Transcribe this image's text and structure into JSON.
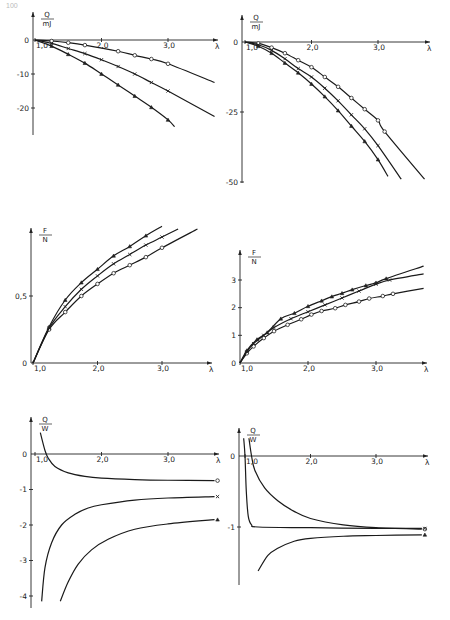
{
  "page": {
    "number": "100"
  },
  "chart_data": [
    {
      "id": "chart1",
      "type": "line",
      "position": "top-left",
      "ylabel_num": "Q",
      "ylabel_den": "mJ",
      "xlabel": "λ",
      "xticks": [
        "1,0",
        "2,0",
        "3,0"
      ],
      "yticks": [
        "0",
        "-10",
        "-20"
      ],
      "xlim": [
        1.0,
        3.7
      ],
      "ylim": [
        -25,
        2
      ],
      "series": [
        {
          "name": "circle",
          "marker": "o",
          "points": [
            [
              1.0,
              0
            ],
            [
              1.25,
              -0.3
            ],
            [
              1.5,
              -0.8
            ],
            [
              1.75,
              -1.5
            ],
            [
              2.25,
              -3.3
            ],
            [
              2.5,
              -4.5
            ],
            [
              2.75,
              -5.6
            ],
            [
              3.0,
              -7.0
            ],
            [
              3.7,
              -12.5
            ]
          ]
        },
        {
          "name": "cross",
          "marker": "x",
          "points": [
            [
              1.0,
              0
            ],
            [
              1.25,
              -1.0
            ],
            [
              1.5,
              -2.5
            ],
            [
              1.75,
              -4.0
            ],
            [
              2.0,
              -5.8
            ],
            [
              2.25,
              -7.8
            ],
            [
              2.5,
              -10.0
            ],
            [
              2.75,
              -12.5
            ],
            [
              3.0,
              -15.0
            ],
            [
              3.7,
              -22.5
            ]
          ]
        },
        {
          "name": "triangle",
          "marker": "^",
          "points": [
            [
              1.0,
              0
            ],
            [
              1.25,
              -1.8
            ],
            [
              1.5,
              -4.2
            ],
            [
              1.75,
              -6.8
            ],
            [
              2.0,
              -10.0
            ],
            [
              2.25,
              -13.2
            ],
            [
              2.5,
              -16.5
            ],
            [
              2.75,
              -19.8
            ],
            [
              3.0,
              -23.5
            ],
            [
              3.1,
              -25.5
            ]
          ]
        }
      ]
    },
    {
      "id": "chart2",
      "type": "line",
      "position": "top-right",
      "ylabel_num": "Q",
      "ylabel_den": "mJ",
      "xlabel": "λ",
      "xticks": [
        "1,0",
        "2,0",
        "3,0"
      ],
      "yticks": [
        "0",
        "-25",
        "-50"
      ],
      "xlim": [
        1.0,
        3.7
      ],
      "ylim": [
        -50,
        2
      ],
      "series": [
        {
          "name": "circle",
          "marker": "o",
          "points": [
            [
              1.0,
              0
            ],
            [
              1.2,
              -0.5
            ],
            [
              1.4,
              -2.0
            ],
            [
              1.6,
              -4.0
            ],
            [
              1.8,
              -6.5
            ],
            [
              2.0,
              -9.0
            ],
            [
              2.2,
              -12.5
            ],
            [
              2.4,
              -16.0
            ],
            [
              2.6,
              -20.0
            ],
            [
              2.8,
              -24.0
            ],
            [
              3.0,
              -28.0
            ],
            [
              3.1,
              -32.0
            ],
            [
              3.7,
              -49.0
            ]
          ]
        },
        {
          "name": "cross",
          "marker": "x",
          "points": [
            [
              1.0,
              0
            ],
            [
              1.2,
              -1.0
            ],
            [
              1.4,
              -3.0
            ],
            [
              1.6,
              -6.0
            ],
            [
              1.8,
              -9.5
            ],
            [
              2.0,
              -12.5
            ],
            [
              2.2,
              -16.5
            ],
            [
              2.4,
              -21.0
            ],
            [
              2.6,
              -26.0
            ],
            [
              2.8,
              -31.0
            ],
            [
              3.0,
              -37.0
            ],
            [
              3.35,
              -49.0
            ]
          ]
        },
        {
          "name": "triangle",
          "marker": "^",
          "points": [
            [
              1.0,
              0
            ],
            [
              1.2,
              -1.5
            ],
            [
              1.4,
              -4.0
            ],
            [
              1.6,
              -7.5
            ],
            [
              1.8,
              -11.0
            ],
            [
              2.0,
              -15.0
            ],
            [
              2.2,
              -19.5
            ],
            [
              2.4,
              -24.5
            ],
            [
              2.6,
              -30.0
            ],
            [
              2.8,
              -35.5
            ],
            [
              3.0,
              -42.0
            ],
            [
              3.15,
              -48.0
            ]
          ]
        }
      ]
    },
    {
      "id": "chart3",
      "type": "line",
      "position": "middle-left",
      "ylabel_num": "F",
      "ylabel_den": "N",
      "xlabel": "λ",
      "xticks": [
        "1,0",
        "2,0",
        "3,0"
      ],
      "yticks": [
        "0",
        "0,5"
      ],
      "xlim": [
        1.0,
        3.7
      ],
      "ylim": [
        0,
        1.05
      ],
      "series": [
        {
          "name": "circle",
          "marker": "o",
          "points": [
            [
              1.0,
              0
            ],
            [
              1.25,
              0.25
            ],
            [
              1.5,
              0.38
            ],
            [
              1.75,
              0.5
            ],
            [
              2.0,
              0.59
            ],
            [
              2.25,
              0.67
            ],
            [
              2.5,
              0.73
            ],
            [
              2.75,
              0.79
            ],
            [
              3.0,
              0.86
            ],
            [
              3.55,
              1.0
            ]
          ]
        },
        {
          "name": "cross",
          "marker": "x",
          "points": [
            [
              1.0,
              0
            ],
            [
              1.25,
              0.26
            ],
            [
              1.5,
              0.42
            ],
            [
              1.75,
              0.55
            ],
            [
              2.0,
              0.65
            ],
            [
              2.25,
              0.74
            ],
            [
              2.5,
              0.81
            ],
            [
              2.75,
              0.88
            ],
            [
              3.0,
              0.94
            ],
            [
              3.25,
              1.0
            ]
          ]
        },
        {
          "name": "triangle",
          "marker": "^",
          "points": [
            [
              1.0,
              0
            ],
            [
              1.25,
              0.27
            ],
            [
              1.5,
              0.47
            ],
            [
              1.75,
              0.6
            ],
            [
              2.0,
              0.7
            ],
            [
              2.25,
              0.8
            ],
            [
              2.5,
              0.87
            ],
            [
              2.75,
              0.95
            ],
            [
              3.0,
              1.02
            ]
          ]
        }
      ]
    },
    {
      "id": "chart4",
      "type": "line",
      "position": "middle-right",
      "ylabel_num": "F",
      "ylabel_den": "N",
      "xlabel": "λ",
      "xticks": [
        "1,0",
        "2,0",
        "3,0"
      ],
      "yticks": [
        "0",
        "1",
        "2",
        "3"
      ],
      "xlim": [
        1.0,
        3.7
      ],
      "ylim": [
        0,
        3.6
      ],
      "series": [
        {
          "name": "circle",
          "marker": "o",
          "points": [
            [
              1.0,
              0
            ],
            [
              1.1,
              0.35
            ],
            [
              1.2,
              0.6
            ],
            [
              1.35,
              0.9
            ],
            [
              1.5,
              1.15
            ],
            [
              1.7,
              1.38
            ],
            [
              1.9,
              1.58
            ],
            [
              2.05,
              1.75
            ],
            [
              2.2,
              1.88
            ],
            [
              2.4,
              1.98
            ],
            [
              2.55,
              2.1
            ],
            [
              2.75,
              2.22
            ],
            [
              2.9,
              2.33
            ],
            [
              3.1,
              2.42
            ],
            [
              3.25,
              2.5
            ],
            [
              3.7,
              2.7
            ]
          ]
        },
        {
          "name": "cross",
          "marker": "x",
          "points": [
            [
              1.0,
              0
            ],
            [
              1.1,
              0.4
            ],
            [
              1.2,
              0.7
            ],
            [
              1.35,
              1.0
            ],
            [
              1.5,
              1.28
            ],
            [
              1.75,
              1.6
            ],
            [
              2.0,
              1.85
            ],
            [
              2.25,
              2.1
            ],
            [
              2.5,
              2.35
            ],
            [
              2.75,
              2.6
            ],
            [
              3.0,
              2.85
            ],
            [
              3.2,
              3.0
            ],
            [
              3.7,
              3.22
            ]
          ]
        },
        {
          "name": "triangle",
          "marker": "^",
          "points": [
            [
              1.0,
              0
            ],
            [
              1.1,
              0.45
            ],
            [
              1.25,
              0.85
            ],
            [
              1.4,
              1.1
            ],
            [
              1.6,
              1.6
            ],
            [
              1.8,
              1.8
            ],
            [
              2.0,
              2.05
            ],
            [
              2.2,
              2.25
            ],
            [
              2.35,
              2.4
            ],
            [
              2.5,
              2.52
            ],
            [
              2.65,
              2.65
            ],
            [
              2.85,
              2.8
            ],
            [
              3.0,
              2.9
            ],
            [
              3.15,
              3.05
            ],
            [
              3.7,
              3.5
            ]
          ]
        }
      ]
    },
    {
      "id": "chart5",
      "type": "line",
      "position": "bottom-left",
      "ylabel_num": "Q",
      "ylabel_den": "W",
      "xlabel": "λ",
      "xticks": [
        "1,0",
        "2,0",
        "3,0"
      ],
      "yticks": [
        "0",
        "-1",
        "-2",
        "-3",
        "-4"
      ],
      "xlim": [
        1.0,
        3.7
      ],
      "ylim": [
        -4.3,
        0.7
      ],
      "series": [
        {
          "name": "circle",
          "marker": "o",
          "points": [
            [
              1.08,
              0.6
            ],
            [
              1.15,
              0.1
            ],
            [
              1.2,
              -0.12
            ],
            [
              1.3,
              -0.35
            ],
            [
              1.5,
              -0.53
            ],
            [
              1.75,
              -0.63
            ],
            [
              2.0,
              -0.68
            ],
            [
              2.5,
              -0.72
            ],
            [
              3.0,
              -0.74
            ],
            [
              3.7,
              -0.75
            ]
          ]
        },
        {
          "name": "cross",
          "marker": "x",
          "points": [
            [
              1.1,
              -4.15
            ],
            [
              1.15,
              -3.2
            ],
            [
              1.25,
              -2.5
            ],
            [
              1.4,
              -2.0
            ],
            [
              1.6,
              -1.7
            ],
            [
              1.8,
              -1.52
            ],
            [
              2.0,
              -1.43
            ],
            [
              2.5,
              -1.3
            ],
            [
              3.0,
              -1.24
            ],
            [
              3.7,
              -1.2
            ]
          ]
        },
        {
          "name": "triangle",
          "marker": "^",
          "points": [
            [
              1.38,
              -4.15
            ],
            [
              1.5,
              -3.6
            ],
            [
              1.65,
              -3.1
            ],
            [
              1.85,
              -2.7
            ],
            [
              2.1,
              -2.4
            ],
            [
              2.5,
              -2.12
            ],
            [
              3.0,
              -1.97
            ],
            [
              3.7,
              -1.85
            ]
          ]
        }
      ]
    },
    {
      "id": "chart6",
      "type": "line",
      "position": "bottom-right",
      "ylabel_num": "Q",
      "ylabel_den": "W",
      "xlabel": "λ",
      "xticks": [
        "1,0",
        "2,0",
        "3,0"
      ],
      "yticks": [
        "0",
        "-1"
      ],
      "xlim": [
        1.0,
        3.7
      ],
      "ylim": [
        -1.7,
        0.3
      ],
      "series": [
        {
          "name": "circle",
          "marker": "o",
          "points": [
            [
              1.06,
              0.25
            ],
            [
              1.1,
              0.0
            ],
            [
              1.15,
              -0.2
            ],
            [
              1.3,
              -0.45
            ],
            [
              1.5,
              -0.63
            ],
            [
              1.75,
              -0.78
            ],
            [
              2.0,
              -0.88
            ],
            [
              2.5,
              -0.97
            ],
            [
              3.0,
              -1.01
            ],
            [
              3.7,
              -1.03
            ]
          ]
        },
        {
          "name": "cross",
          "marker": "x",
          "points": [
            [
              0.98,
              0.25
            ],
            [
              1.0,
              0.0
            ],
            [
              1.02,
              -0.5
            ],
            [
              1.05,
              -0.85
            ],
            [
              1.1,
              -0.97
            ],
            [
              1.2,
              -1.0
            ],
            [
              2.0,
              -1.01
            ],
            [
              3.0,
              -1.02
            ],
            [
              3.7,
              -1.02
            ]
          ]
        },
        {
          "name": "triangle",
          "marker": "^",
          "points": [
            [
              1.2,
              -1.62
            ],
            [
              1.35,
              -1.4
            ],
            [
              1.5,
              -1.3
            ],
            [
              1.75,
              -1.2
            ],
            [
              2.0,
              -1.16
            ],
            [
              2.5,
              -1.13
            ],
            [
              3.0,
              -1.12
            ],
            [
              3.7,
              -1.11
            ]
          ]
        }
      ]
    }
  ]
}
